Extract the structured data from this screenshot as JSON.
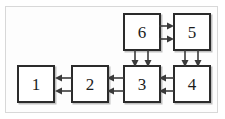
{
  "diagram": {
    "frame": {
      "border_color": "#d8d8d8",
      "background": "#fdfdfd"
    },
    "node_style": {
      "border_color": "#2b2b2b",
      "fill": "#ffffff",
      "text_color": "#1c1c1c"
    },
    "arrow_style": {
      "color": "#3a3a3a"
    },
    "nodes": [
      {
        "id": "node-1",
        "label": "1",
        "x": 16,
        "y": 64,
        "w": 38,
        "h": 38
      },
      {
        "id": "node-2",
        "label": "2",
        "x": 70,
        "y": 64,
        "w": 38,
        "h": 38
      },
      {
        "id": "node-3",
        "label": "3",
        "x": 122,
        "y": 64,
        "w": 38,
        "h": 38
      },
      {
        "id": "node-4",
        "label": "4",
        "x": 172,
        "y": 64,
        "w": 38,
        "h": 38
      },
      {
        "id": "node-5",
        "label": "5",
        "x": 172,
        "y": 12,
        "w": 38,
        "h": 38
      },
      {
        "id": "node-6",
        "label": "6",
        "x": 122,
        "y": 12,
        "w": 38,
        "h": 38
      }
    ],
    "connections": [
      {
        "id": "conn-2-to-1",
        "from": "2",
        "to": "1",
        "direction": "left",
        "count": 2
      },
      {
        "id": "conn-3-to-2",
        "from": "3",
        "to": "2",
        "direction": "left",
        "count": 2
      },
      {
        "id": "conn-4-to-3",
        "from": "4",
        "to": "3",
        "direction": "left",
        "count": 2
      },
      {
        "id": "conn-6-to-5",
        "from": "6",
        "to": "5",
        "direction": "right",
        "count": 2
      },
      {
        "id": "conn-6-to-3",
        "from": "6",
        "to": "3",
        "direction": "down",
        "count": 2
      },
      {
        "id": "conn-5-to-4",
        "from": "5",
        "to": "4",
        "direction": "down",
        "count": 2
      }
    ]
  }
}
